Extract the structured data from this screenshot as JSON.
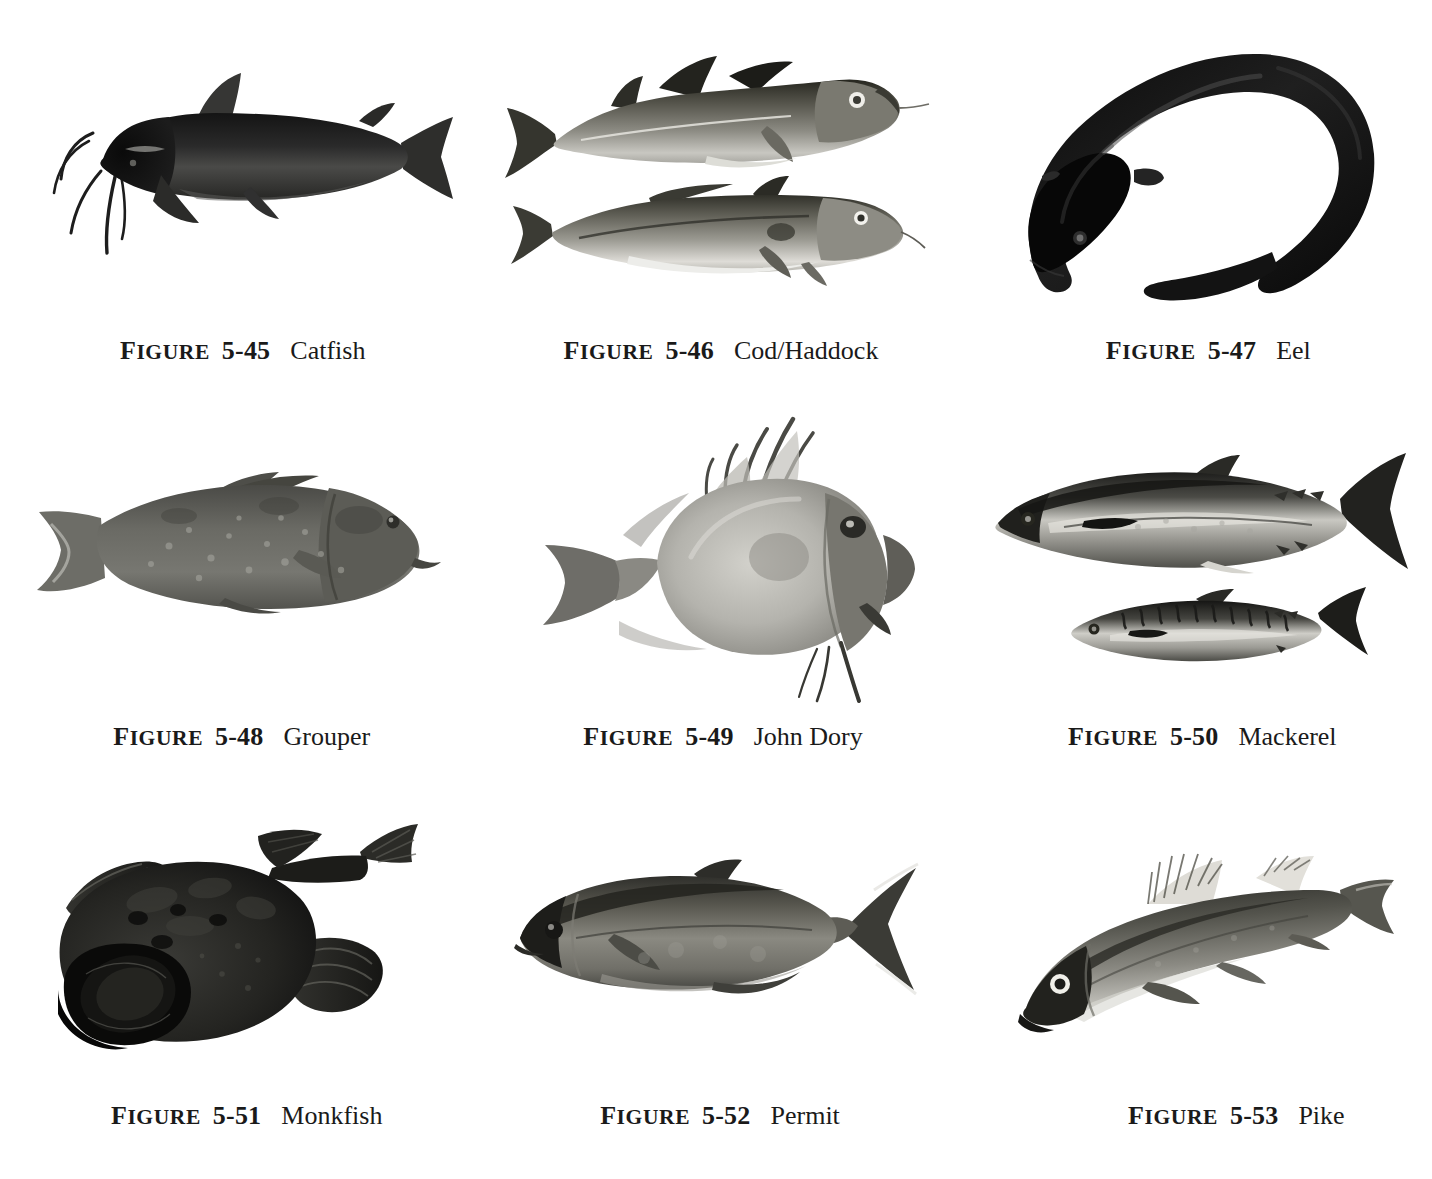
{
  "page": {
    "background_color": "#ffffff",
    "text_color": "#1a1a1a",
    "layout": "3x3 grid of black-and-white fish photographs with figure captions"
  },
  "caption_label": "FIGURE",
  "figures": [
    {
      "id": "catfish",
      "label": "FIGURE",
      "number": "5-45",
      "name": "Catfish",
      "caption_full": "FIGURE 5-45   Catfish",
      "subject": "catfish",
      "specimen_count": 1,
      "orientation": "facing left",
      "tone": "very dark, near black",
      "features": "long barbels, adipose and dorsal fins, forked tail"
    },
    {
      "id": "cod-haddock",
      "label": "FIGURE",
      "number": "5-46",
      "name": "Cod/Haddock",
      "caption_full": "FIGURE 5-46   Cod/Haddock",
      "subject": "cod and haddock",
      "specimen_count": 2,
      "orientation": "facing right",
      "tone": "mid grey back, pale belly",
      "features": "three dorsal fins, chin barbel, lateral line"
    },
    {
      "id": "eel",
      "label": "FIGURE",
      "number": "5-47",
      "name": "Eel",
      "caption_full": "FIGURE 5-47   Eel",
      "subject": "eel",
      "specimen_count": 1,
      "orientation": "curved hook, head lower left",
      "tone": "near black",
      "features": "elongated serpentine body, tapering tail"
    },
    {
      "id": "grouper",
      "label": "FIGURE",
      "number": "5-48",
      "name": "Grouper",
      "caption_full": "FIGURE 5-48   Grouper",
      "subject": "grouper",
      "specimen_count": 1,
      "orientation": "facing right",
      "tone": "mottled medium grey",
      "features": "deep stocky body, broad rounded tail, pale speckles"
    },
    {
      "id": "john-dory",
      "label": "FIGURE",
      "number": "5-49",
      "name": "John Dory",
      "caption_full": "FIGURE 5-49   John Dory",
      "subject": "john dory",
      "specimen_count": 1,
      "orientation": "facing right",
      "tone": "light silvery grey",
      "features": "deep oval disc body, long dorsal spine filaments, large eye"
    },
    {
      "id": "mackerel",
      "label": "FIGURE",
      "number": "5-50",
      "name": "Mackerel",
      "caption_full": "FIGURE 5-50   Mackerel",
      "subject": "mackerel",
      "specimen_count": 2,
      "orientation": "facing left",
      "tone": "dark back, silvery flank",
      "features": "streamlined body, finlets, deeply forked tail, wavy bars on smaller fish"
    },
    {
      "id": "monkfish",
      "label": "FIGURE",
      "number": "5-51",
      "name": "Monkfish",
      "caption_full": "FIGURE 5-51   Monkfish",
      "subject": "monkfish",
      "specimen_count": 1,
      "orientation": "head lower left, tail upper right",
      "tone": "very dark mottled",
      "features": "enormous flattened head and mouth, broad fan pectoral fins"
    },
    {
      "id": "permit",
      "label": "FIGURE",
      "number": "5-52",
      "name": "Permit",
      "caption_full": "FIGURE 5-52   Permit",
      "subject": "permit",
      "specimen_count": 1,
      "orientation": "facing left",
      "tone": "medium grey, silvery",
      "features": "oval compressed body, deeply forked lyre tail, narrow peduncle"
    },
    {
      "id": "pike",
      "label": "FIGURE",
      "number": "5-53",
      "name": "Pike",
      "caption_full": "FIGURE 5-53   Pike",
      "subject": "pike",
      "specimen_count": 1,
      "orientation": "angled down to the left",
      "tone": "dark grey back, pale belly",
      "features": "elongated body, tall pale spiny dorsal fin, large eye"
    }
  ]
}
